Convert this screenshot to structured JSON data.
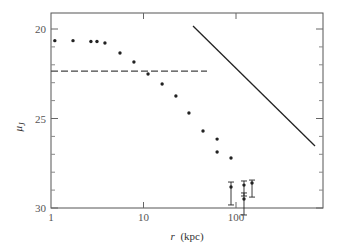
{
  "chart_data": {
    "type": "scatter",
    "title": "",
    "xlabel": "r (kpc)",
    "xlabel_italic": "r",
    "xlabel_unit": "(kpc)",
    "ylabel": "μ_J",
    "xscale": "log",
    "xlim": [
      1,
      1000
    ],
    "ylim": [
      30,
      19.15
    ],
    "y_inverted": true,
    "grid": false,
    "legend": null,
    "x_ticks": [
      {
        "value": 1,
        "label": "1"
      },
      {
        "value": 10,
        "label": "10"
      },
      {
        "value": 100,
        "label": "100"
      }
    ],
    "y_ticks": [
      {
        "value": 20,
        "label": "20"
      },
      {
        "value": 25,
        "label": "25"
      },
      {
        "value": 30,
        "label": "30"
      }
    ],
    "y_minor_ticks": [
      21,
      22,
      23,
      24,
      26,
      27,
      28,
      29
    ],
    "series": [
      {
        "name": "surface brightness profile",
        "kind": "points",
        "color": "#222222",
        "points": [
          {
            "x": 1.1,
            "y": 20.65
          },
          {
            "x": 1.73,
            "y": 20.65
          },
          {
            "x": 2.7,
            "y": 20.7
          },
          {
            "x": 3.14,
            "y": 20.7
          },
          {
            "x": 3.83,
            "y": 20.78
          },
          {
            "x": 5.57,
            "y": 21.34
          },
          {
            "x": 7.88,
            "y": 21.84
          },
          {
            "x": 11.2,
            "y": 22.51
          },
          {
            "x": 15.9,
            "y": 23.07
          },
          {
            "x": 22.4,
            "y": 23.74
          },
          {
            "x": 31.0,
            "y": 24.69
          },
          {
            "x": 44.0,
            "y": 25.7
          },
          {
            "x": 62.5,
            "y": 26.15
          },
          {
            "x": 62.5,
            "y": 26.87
          },
          {
            "x": 88.3,
            "y": 27.21
          }
        ]
      },
      {
        "name": "outer points with error bars",
        "kind": "errorbar",
        "color": "#222222",
        "points": [
          {
            "x": 88.3,
            "y": 28.83,
            "ylow": 28.55,
            "yhigh": 29.83
          },
          {
            "x": 122,
            "y": 28.72,
            "ylow": 28.49,
            "yhigh": 29.33
          },
          {
            "x": 122,
            "y": 29.5,
            "ylow": 29.16,
            "yhigh": 30.39
          },
          {
            "x": 149,
            "y": 28.6,
            "ylow": 28.44,
            "yhigh": 29.39
          }
        ]
      },
      {
        "name": "horizontal dashed level",
        "kind": "dashed-line",
        "color": "#444444",
        "points": [
          {
            "x": 1,
            "y": 22.35
          },
          {
            "x": 48.6,
            "y": 22.35
          }
        ]
      },
      {
        "name": "solid power-law line",
        "kind": "line",
        "color": "#222222",
        "points": [
          {
            "x": 34.3,
            "y": 19.83
          },
          {
            "x": 715,
            "y": 26.54
          }
        ]
      }
    ]
  },
  "layout": {
    "frame": {
      "left": 51,
      "top": 13,
      "right": 323,
      "bottom": 208
    },
    "px_per_decade": 92.5,
    "y_zero_px": 29,
    "px_per_unit_y": 17.9
  }
}
